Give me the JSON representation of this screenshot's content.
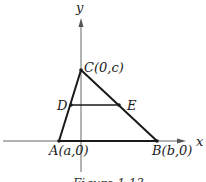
{
  "figure": {
    "caption": "Figure 1.13",
    "axes": {
      "x_label": "x",
      "y_label": "y"
    },
    "points": {
      "A": {
        "label": "A(a,0)",
        "name": "A"
      },
      "B": {
        "label": "B(b,0)",
        "name": "B"
      },
      "C": {
        "label": "C(0,c)",
        "name": "C"
      },
      "D": {
        "label": "D",
        "name": "D"
      },
      "E": {
        "label": "E",
        "name": "E"
      }
    },
    "segments": [
      "AC",
      "CB",
      "AB",
      "DE"
    ],
    "colors": {
      "stroke": "#1a1a1a",
      "axis": "#555555",
      "background": "#ffffff"
    }
  }
}
